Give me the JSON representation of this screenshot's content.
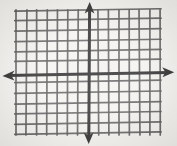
{
  "figure": {
    "background_color": "#f2f1ee",
    "grid_line_color": "#454545",
    "axis_color": "#111111",
    "width": 177,
    "height": 146
  },
  "chart_data": {
    "type": "scatter",
    "title": "",
    "subtitle": "",
    "xlabel": "",
    "ylabel": "",
    "series": [],
    "x": [],
    "values": [],
    "categories": [],
    "xlim": [
      -7,
      7
    ],
    "ylim": [
      -6,
      6
    ],
    "xticks": [
      -7,
      -6,
      -5,
      -4,
      -3,
      -2,
      -1,
      0,
      1,
      2,
      3,
      4,
      5,
      6,
      7
    ],
    "yticks": [
      -6,
      -5,
      -4,
      -3,
      -2,
      -1,
      0,
      1,
      2,
      3,
      4,
      5,
      6
    ],
    "xtick_labels": [],
    "ytick_labels": [],
    "grid": true,
    "grid_columns": 15,
    "grid_rows": 13,
    "legend": false,
    "legend_position": "none",
    "annotations": [],
    "axes": {
      "x_axis": {
        "name": "x-axis",
        "orientation": "horizontal",
        "pixel_y": 74,
        "arrowheads": "both",
        "left_arrow_x": 4,
        "right_arrow_x": 172
      },
      "y_axis": {
        "name": "y-axis",
        "orientation": "vertical",
        "pixel_x": 90,
        "arrowheads": "both",
        "top_arrow_y": 3,
        "bottom_arrow_y": 142
      }
    },
    "plot_area": {
      "left": 16,
      "right": 160,
      "top": 11,
      "bottom": 134,
      "cell_width": 10.3,
      "cell_height": 10.25
    }
  },
  "geometry": {
    "vertical_lines_x": [
      16.0,
      26.3,
      36.6,
      46.9,
      57.2,
      67.5,
      77.8,
      90.0,
      98.4,
      108.7,
      119.0,
      129.3,
      139.6,
      149.9,
      160.2
    ],
    "horizontal_lines_y": [
      11.0,
      21.2,
      31.5,
      41.7,
      52.0,
      62.2,
      74.0,
      82.7,
      93.0,
      103.2,
      113.5,
      123.7,
      134.0
    ]
  }
}
